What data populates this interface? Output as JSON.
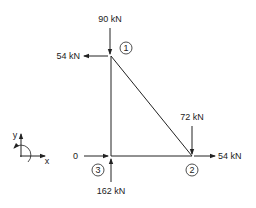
{
  "diagram": {
    "type": "truss free-body diagram",
    "nodes": [
      {
        "id": "1",
        "label": "1"
      },
      {
        "id": "2",
        "label": "2"
      },
      {
        "id": "3",
        "label": "3"
      }
    ],
    "members": [
      {
        "from": "1",
        "to": "2"
      },
      {
        "from": "1",
        "to": "3"
      },
      {
        "from": "3",
        "to": "2"
      }
    ],
    "loads": [
      {
        "node": "1",
        "direction": "down",
        "label": "90 kN"
      },
      {
        "node": "1",
        "direction": "left",
        "label": "54 kN"
      },
      {
        "node": "2",
        "direction": "down",
        "label": "72 kN"
      },
      {
        "node": "2",
        "direction": "right",
        "label": "54 kN"
      },
      {
        "node": "3",
        "direction": "right",
        "label": "0"
      },
      {
        "node": "3",
        "direction": "up",
        "label": "162 kN"
      }
    ],
    "axes": {
      "x_label": "x",
      "y_label": "y"
    }
  }
}
